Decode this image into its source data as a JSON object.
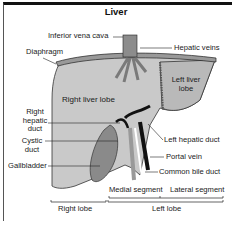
{
  "title": "Liver",
  "labels": {
    "inferior_vena_cava": "Inferior vena cava",
    "hepatic_veins": "Hepatic veins",
    "diaphragm": "Diaphragm",
    "left_liver_lobe_1": "Left liver",
    "left_liver_lobe_2": "lobe",
    "right_liver_lobe": "Right liver lobe",
    "right_hepatic_duct_1": "Right",
    "right_hepatic_duct_2": "hepatic",
    "right_hepatic_duct_3": "duct",
    "cystic_duct_1": "Cystic",
    "cystic_duct_2": "duct",
    "gallbladder": "Gallbladder",
    "left_hepatic_duct": "Left hepatic duct",
    "portal_vein": "Portal vein",
    "common_bile_duct": "Common bile duct",
    "medial_segment": "Medial segment",
    "lateral_segment": "Lateral segment",
    "right_lobe": "Right lobe",
    "left_lobe": "Left lobe"
  },
  "colors": {
    "liver_right": "#c8c8c8",
    "liver_left": "#bdbdbd",
    "gallbladder": "#8a8a8a",
    "vessel_dark": "#111111",
    "frame": "#111111"
  }
}
